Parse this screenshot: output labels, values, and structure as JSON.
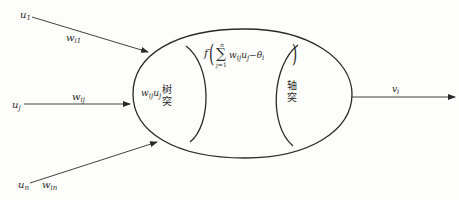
{
  "diagram": {
    "type": "neuron-model",
    "inputs": [
      {
        "node": "u",
        "node_sub": "1",
        "weight": "w",
        "weight_sub": "i1"
      },
      {
        "node": "u",
        "node_sub": "j",
        "weight": "w",
        "weight_sub": "ij"
      },
      {
        "node": "u",
        "node_sub": "n",
        "weight": "w",
        "weight_sub": "in"
      }
    ],
    "cell_body": {
      "dendrite_term": {
        "w": "w",
        "w_sub": "ij",
        "u": "u",
        "u_sub": "j"
      },
      "dendrite_label": [
        "树",
        "突"
      ],
      "activation": {
        "f": "f",
        "sum_top": "n",
        "sum_bottom": "j=1",
        "body": "w",
        "body_w_sub": "ij",
        "body_u": "u",
        "body_u_sub": "j",
        "minus": "−θ",
        "theta_sub": "i"
      },
      "axon_label": [
        "轴",
        "突"
      ]
    },
    "output": {
      "node": "v",
      "node_sub": "i"
    },
    "colors": {
      "stroke": "#2a2a2a",
      "background": "#fdfdfc"
    }
  }
}
